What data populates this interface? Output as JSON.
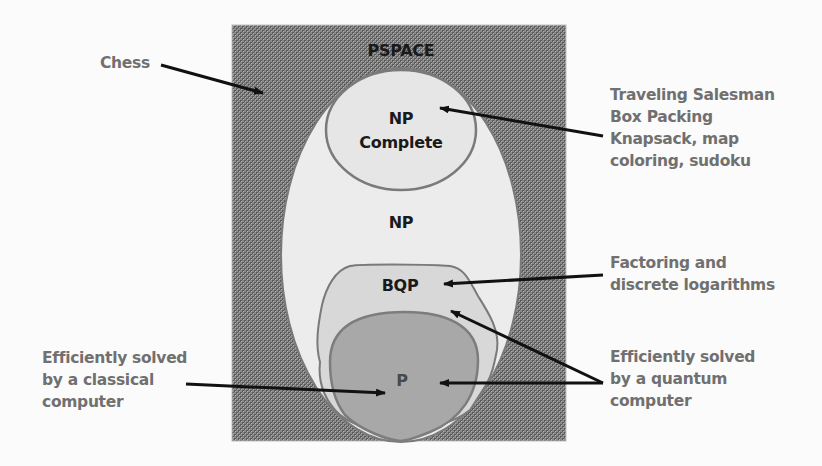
{
  "diagram": {
    "type": "complexity-class-nesting",
    "colors": {
      "page_background": "#fbfbfb",
      "pspace_fill": "#777777",
      "np_fill": "#ececec",
      "np_complete_fill": "#e6e6e6",
      "bqp_fill": "#d8d8d8",
      "p_fill": "#a8a8a8",
      "outline": "#7a7a7a",
      "arrow": "#111111",
      "annotation_text": "#707070",
      "class_text": "#1a1a1a"
    },
    "regions": {
      "pspace": {
        "label": "PSPACE"
      },
      "np_complete": {
        "label_line1": "NP",
        "label_line2": "Complete"
      },
      "np": {
        "label": "NP"
      },
      "bqp": {
        "label": "BQP"
      },
      "p": {
        "label": "P"
      }
    },
    "annotations": {
      "chess": {
        "lines": [
          "Chess"
        ],
        "points_to": "PSPACE"
      },
      "np_complete_examples": {
        "lines": [
          "Traveling Salesman",
          "Box Packing",
          "Knapsack, map",
          "coloring, sudoku"
        ],
        "points_to": "NP Complete"
      },
      "bqp_examples": {
        "lines": [
          "Factoring and",
          "discrete logarithms"
        ],
        "points_to": "BQP"
      },
      "quantum": {
        "lines": [
          "Efficiently solved",
          "by a quantum",
          "computer"
        ],
        "points_to": [
          "BQP",
          "P"
        ]
      },
      "classical": {
        "lines": [
          "Efficiently solved",
          "by a classical",
          "computer"
        ],
        "points_to": "P"
      }
    }
  }
}
